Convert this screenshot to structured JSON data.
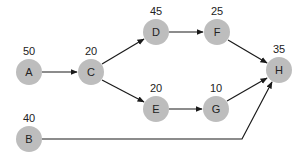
{
  "diagram": {
    "type": "network-activity-graph",
    "node_color": "#bdbdbd",
    "edge_color": "#1a1a1a",
    "nodes": [
      {
        "id": "A",
        "label": "A",
        "value": "50",
        "x": 29,
        "y": 72
      },
      {
        "id": "B",
        "label": "B",
        "value": "40",
        "x": 29,
        "y": 139
      },
      {
        "id": "C",
        "label": "C",
        "value": "20",
        "x": 91,
        "y": 72
      },
      {
        "id": "D",
        "label": "D",
        "value": "45",
        "x": 156,
        "y": 32
      },
      {
        "id": "E",
        "label": "E",
        "value": "20",
        "x": 156,
        "y": 109
      },
      {
        "id": "F",
        "label": "F",
        "value": "25",
        "x": 217,
        "y": 32
      },
      {
        "id": "G",
        "label": "G",
        "value": "10",
        "x": 216,
        "y": 109
      },
      {
        "id": "H",
        "label": "H",
        "value": "35",
        "x": 279,
        "y": 70
      }
    ],
    "edges": [
      {
        "from": "A",
        "to": "C"
      },
      {
        "from": "C",
        "to": "D"
      },
      {
        "from": "C",
        "to": "E"
      },
      {
        "from": "D",
        "to": "F"
      },
      {
        "from": "E",
        "to": "G"
      },
      {
        "from": "F",
        "to": "H"
      },
      {
        "from": "G",
        "to": "H"
      },
      {
        "from": "B",
        "to": "H",
        "via": [
          [
            242,
            139
          ]
        ]
      }
    ]
  }
}
